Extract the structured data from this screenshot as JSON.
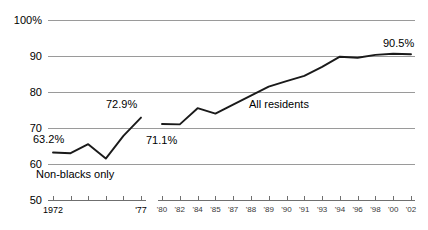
{
  "chart_data": {
    "type": "line",
    "title": "",
    "xlabel": "",
    "ylabel": "",
    "ylim": [
      50,
      100
    ],
    "grid": true,
    "legend": "inline-annotations",
    "y_ticks": [
      "100%",
      "90",
      "80",
      "70",
      "60",
      "50"
    ],
    "y_tick_values": [
      100,
      90,
      80,
      70,
      60,
      50
    ],
    "panels": [
      {
        "name": "left-panel",
        "series_label": "Non-blacks only",
        "x_ticks": [
          "1972",
          "",
          "",
          "",
          "",
          "'77"
        ],
        "x_tick_values": [
          1972,
          1973,
          1974,
          1975,
          1976,
          1977
        ],
        "values": [
          63.2,
          63.0,
          65.5,
          61.5,
          67.8,
          72.9
        ],
        "first_value_label": "63.2%",
        "last_value_label": "72.9%"
      },
      {
        "name": "right-panel",
        "series_label": "All residents",
        "x_ticks": [
          "'80",
          "'82",
          "'84",
          "'85",
          "'87",
          "'88",
          "'89",
          "'90",
          "'91",
          "'93",
          "'94",
          "'96",
          "'98",
          "'00",
          "'02"
        ],
        "x_tick_values": [
          1980,
          1982,
          1984,
          1985,
          1987,
          1988,
          1989,
          1990,
          1991,
          1993,
          1994,
          1996,
          1998,
          2000,
          2002
        ],
        "values": [
          71.1,
          71.0,
          75.5,
          74.0,
          76.5,
          79.0,
          81.5,
          83.0,
          84.5,
          87.0,
          89.8,
          89.5,
          90.3,
          90.6,
          90.5
        ],
        "first_value_label": "71.1%",
        "last_value_label": "90.5%"
      }
    ],
    "annotations": [
      {
        "text": "63.2%",
        "x": 1972,
        "y": 63.2
      },
      {
        "text": "72.9%",
        "x": 1977,
        "y": 72.9
      },
      {
        "text": "Non-blacks only",
        "x": 1973,
        "y": 58
      },
      {
        "text": "71.1%",
        "x": 1980,
        "y": 68
      },
      {
        "text": "All residents",
        "x": 1988,
        "y": 76
      },
      {
        "text": "90.5%",
        "x": 2002,
        "y": 93
      }
    ],
    "colors": {
      "line": "#1a1a1a",
      "gridline": "#9a9a9a",
      "axis": "#6f6f6f",
      "background": "#ffffff",
      "text": "#000000"
    }
  }
}
